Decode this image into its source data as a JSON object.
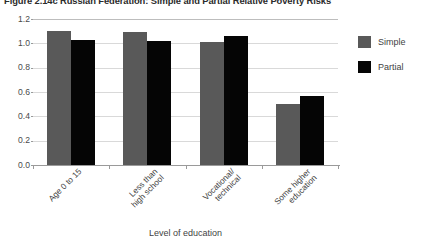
{
  "figure": {
    "title": "Figure 2.14c  Russian Federation: Simple and Partial Relative Poverty Risks"
  },
  "legend": {
    "position": "right",
    "entries": [
      {
        "label": "Simple",
        "color": "#595959",
        "swatch_name": "legend-swatch-simple"
      },
      {
        "label": "Partial",
        "color": "#050505",
        "swatch_name": "legend-swatch-partial"
      }
    ]
  },
  "axes": {
    "x_title": "Level of education",
    "y_title": "",
    "y_ticks": [
      "1.2",
      "1.0",
      "0.8",
      "0.6",
      "0.4",
      "0.2",
      "0.0"
    ]
  },
  "chart_data": {
    "type": "bar",
    "title": "Figure 2.14c  Russian Federation: Simple and Partial Relative Poverty Risks",
    "xlabel": "Level of education",
    "ylabel": "",
    "ylim": [
      0.0,
      1.2
    ],
    "ytick_step": 0.2,
    "grid": true,
    "legend_position": "right",
    "categories": [
      "Age 0 to 15",
      "Less than\nhigh school",
      "Vocational/\ntechnical",
      "Some higher\neducation"
    ],
    "series": [
      {
        "name": "Simple",
        "color": "#595959",
        "values": [
          1.1,
          1.09,
          1.01,
          0.5
        ]
      },
      {
        "name": "Partial",
        "color": "#050505",
        "values": [
          1.03,
          1.02,
          1.06,
          0.57
        ]
      }
    ]
  }
}
